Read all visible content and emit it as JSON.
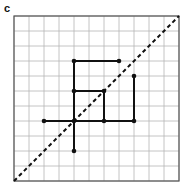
{
  "panel_label": "c",
  "grid": {
    "cells": 11,
    "origin_px": [
      14,
      181
    ],
    "cell_px": 15
  },
  "diagonal": {
    "from": [
      0,
      0
    ],
    "to": [
      11,
      11
    ],
    "style": "dashed"
  },
  "segments": [
    {
      "from": [
        4,
        8
      ],
      "to": [
        7,
        8
      ]
    },
    {
      "from": [
        4,
        8
      ],
      "to": [
        4,
        2
      ]
    },
    {
      "from": [
        4,
        6
      ],
      "to": [
        6,
        6
      ]
    },
    {
      "from": [
        6,
        6
      ],
      "to": [
        6,
        4
      ]
    },
    {
      "from": [
        2,
        4
      ],
      "to": [
        8,
        4
      ]
    },
    {
      "from": [
        8,
        4
      ],
      "to": [
        8,
        7
      ]
    }
  ],
  "points": [
    [
      4,
      8
    ],
    [
      7,
      8
    ],
    [
      4,
      6
    ],
    [
      6,
      6
    ],
    [
      6,
      4
    ],
    [
      8,
      4
    ],
    [
      8,
      7
    ],
    [
      2,
      4
    ],
    [
      4,
      4
    ],
    [
      4,
      2
    ]
  ],
  "colors": {
    "line": "#111111",
    "grid": "#b5b5b5",
    "border": "#555555"
  }
}
